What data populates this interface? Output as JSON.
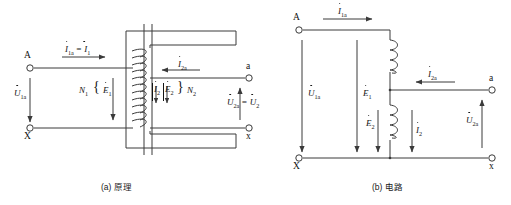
{
  "figure": {
    "width": 511,
    "height": 205,
    "line_color": "#3a3a3a",
    "text_color": "#141414",
    "background": "#ffffff"
  },
  "panel_a": {
    "caption": "(a) 原理",
    "terminals": {
      "top_left": "A",
      "bottom_left": "X",
      "top_right": "a",
      "bottom_right": "x"
    },
    "labels": {
      "primary_current": "I",
      "primary_current_sub": "1a",
      "primary_current_eq": "= I",
      "primary_current_eq_sub": "1",
      "primary_voltage": "U",
      "primary_voltage_sub": "1a",
      "primary_turns": "N",
      "primary_turns_sub": "1",
      "primary_emf": "E",
      "primary_emf_sub": "1",
      "secondary_current_line": "I",
      "secondary_current_line_sub": "2a",
      "secondary_current": "I",
      "secondary_current_sub": "2",
      "secondary_emf": "E",
      "secondary_emf_sub": "2",
      "secondary_turns": "N",
      "secondary_turns_sub": "2",
      "secondary_voltage": "U",
      "secondary_voltage_sub": "2a",
      "secondary_voltage_eq": "= U",
      "secondary_voltage_eq_sub": "2",
      "brace_primary": "{",
      "brace_secondary": "}"
    }
  },
  "panel_b": {
    "caption": "(b) 电路",
    "terminals": {
      "top_left": "A",
      "bottom_left": "X",
      "top_right": "a",
      "bottom_right": "x"
    },
    "labels": {
      "input_current": "I",
      "input_current_sub": "1a",
      "input_voltage": "U",
      "input_voltage_sub": "1a",
      "emf_primary": "E",
      "emf_primary_sub": "1",
      "emf_secondary": "E",
      "emf_secondary_sub": "2",
      "branch_current": "I",
      "branch_current_sub": "2",
      "output_current": "I",
      "output_current_sub": "2a",
      "output_voltage": "U",
      "output_voltage_sub": "2a"
    }
  }
}
